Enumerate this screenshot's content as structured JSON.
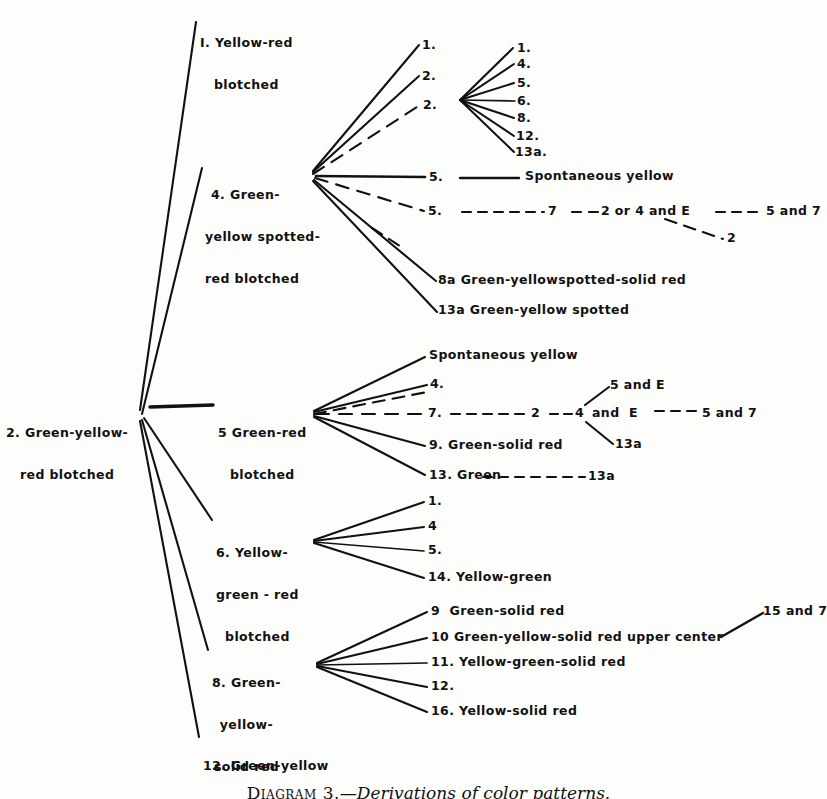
{
  "figure": {
    "caption_label": "Diagram 3.",
    "caption_text": "—Derivations of color patterns.",
    "caption_full": "Diagram 3.—Derivations of color patterns.",
    "ink_color": "#111111",
    "paper_color": "#fdfdfb"
  },
  "root": {
    "id": "2",
    "line1": "2. Green-yellow-",
    "line2": "red blotched"
  },
  "nodes": {
    "n1": {
      "line1": "I. Yellow-red",
      "line2": "blotched"
    },
    "n4": {
      "line1": "4. Green-",
      "line2": "yellow spotted-",
      "line3": "red blotched"
    },
    "n5": {
      "line1": "5 Green-red",
      "line2": "blotched"
    },
    "n6": {
      "line1": "6. Yellow-",
      "line2": "green - red",
      "line3": "blotched"
    },
    "n8": {
      "line1": "8. Green-",
      "line2": "yellow-",
      "line3": "solid red"
    },
    "n12": {
      "line1": "12. Green-yellow"
    }
  },
  "branch4": {
    "primary": [
      {
        "label": "1."
      },
      {
        "label": "2."
      },
      {
        "label": "2."
      }
    ],
    "secondary_fan": [
      {
        "label": "1."
      },
      {
        "label": "4."
      },
      {
        "label": "5."
      },
      {
        "label": "6."
      },
      {
        "label": "8."
      },
      {
        "label": "12."
      },
      {
        "label": "13a."
      }
    ],
    "spontaneous": {
      "num": "5.",
      "text": "Spontaneous yellow"
    },
    "chain": {
      "num": "5.",
      "step1": "7",
      "step2": "2 or 4 and E",
      "step3": "5 and 7",
      "drop": "2"
    },
    "lower": [
      {
        "label": "8a Green-yellowspotted-solid red"
      },
      {
        "label": "13a Green-yellow spotted"
      }
    ]
  },
  "branch5": {
    "items": [
      {
        "label": "Spontaneous yellow"
      },
      {
        "label": "4."
      },
      {
        "label": "7."
      },
      {
        "label": "9. Green-solid red"
      },
      {
        "label": "13. Green"
      }
    ],
    "chain": {
      "step1": "7.",
      "step2": "2",
      "step3": "4",
      "step4": "and  E",
      "step5": "5 and 7",
      "up": "5 and E",
      "down": "13a"
    },
    "green13a": "13a"
  },
  "branch6": {
    "items": [
      {
        "label": "1."
      },
      {
        "label": "4"
      },
      {
        "label": "5."
      },
      {
        "label": "14. Yellow-green"
      }
    ]
  },
  "branch8": {
    "items": [
      {
        "label": "9  Green-solid red"
      },
      {
        "label": "10 Green-yellow-solid red upper center"
      },
      {
        "label": "11. Yellow-green-solid red"
      },
      {
        "label": "12."
      },
      {
        "label": "16. Yellow-solid red"
      }
    ],
    "annotation": "15 and 7"
  }
}
